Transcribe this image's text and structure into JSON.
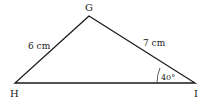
{
  "diagram": {
    "vertices": [
      {
        "name": "G",
        "x": 89,
        "y": 16
      },
      {
        "name": "H",
        "x": 15,
        "y": 83
      },
      {
        "name": "I",
        "x": 195,
        "y": 83
      }
    ],
    "sides": [
      {
        "between": "GH",
        "label": "6 cm"
      },
      {
        "between": "GI",
        "label": "7 cm"
      },
      {
        "between": "HI",
        "label": ""
      }
    ],
    "angle": {
      "vertex": "I",
      "label": "40°"
    },
    "colors": {
      "stroke": "#1a1a1a",
      "text": "#222222"
    }
  }
}
